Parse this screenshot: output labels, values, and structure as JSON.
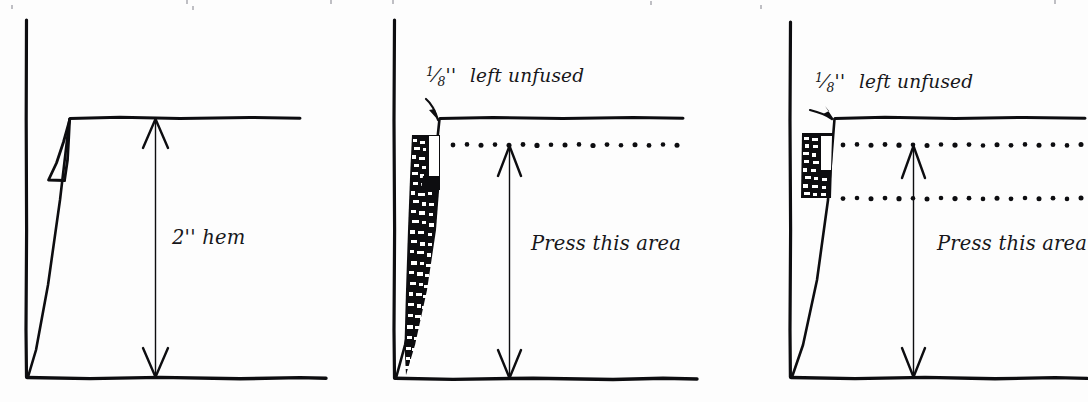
{
  "figure": {
    "background_color": "#fdfdfd",
    "ink_color": "#0d0d10",
    "panel_count": 3
  },
  "panels": [
    {
      "id": "panel-1",
      "name": "plain-hem",
      "label_main": "2'' hem",
      "label_top": "",
      "fraction": null,
      "dotted_lines": 0,
      "has_fusible_web": false,
      "arrow": {
        "orientation": "vertical-double",
        "top_y": 118,
        "bottom_y": 377,
        "x": 177
      },
      "notes": "Folded hem with small triangular fold flap at upper left"
    },
    {
      "id": "panel-2",
      "name": "wide-fusible-strip",
      "label_main": "Press this area",
      "label_top": "left unfused",
      "fraction": {
        "numerator": "1",
        "denominator": "8",
        "units": "''"
      },
      "dotted_lines": 1,
      "has_fusible_web": true,
      "arrow": {
        "orientation": "vertical-double",
        "top_y": 145,
        "bottom_y": 378,
        "x": 509
      },
      "notes": "Tapered speckled fusible web strip along the fold; one dotted guide line"
    },
    {
      "id": "panel-3",
      "name": "narrow-fusible-strip",
      "label_main": "Press this area",
      "label_top": "left unfused",
      "fraction": {
        "numerator": "1",
        "denominator": "8",
        "units": "''"
      },
      "dotted_lines": 2,
      "has_fusible_web": true,
      "arrow": {
        "orientation": "vertical-double",
        "top_y": 145,
        "bottom_y": 377,
        "x": 913
      },
      "notes": "Compact rectangular speckled fusible block; two dotted guide lines"
    }
  ],
  "colors": {
    "ink": "#0d0d10",
    "paper": "#fdfdfd",
    "speck": "#ffffff",
    "faint_crumb": "#bfbfc4"
  }
}
